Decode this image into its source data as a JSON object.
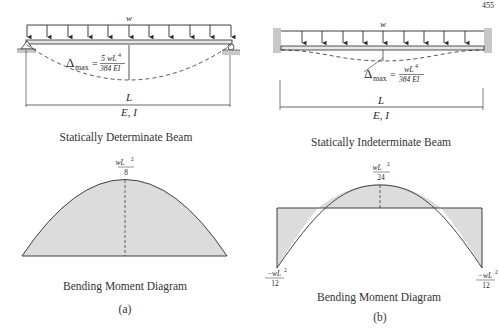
{
  "page": {
    "number": "455"
  },
  "panel_a": {
    "load_label": "w",
    "deflection_label": {
      "symbol": "Δ",
      "sub": "max",
      "eq": "=",
      "num": "5 wL",
      "num_exp": "4",
      "den": "384 EI"
    },
    "span_label": "L",
    "property_label": "E, I",
    "beam_caption": "Statically Determinate Beam",
    "moment_label": {
      "num": "wL",
      "exp": "2",
      "den": "8"
    },
    "moment_caption": "Bending Moment Diagram",
    "subfigure": "(a)"
  },
  "panel_b": {
    "load_label": "w",
    "deflection_label": {
      "symbol": "Δ",
      "sub": "max",
      "eq": "=",
      "num": "wL",
      "num_exp": "4",
      "den": "384 EI"
    },
    "span_label": "L",
    "property_label": "E, I",
    "beam_caption": "Statically Indeterminate Beam",
    "moment_label_mid": {
      "num": "wL",
      "exp": "2",
      "den": "24"
    },
    "moment_label_left": {
      "num": "−wL",
      "exp": "2",
      "den": "12"
    },
    "moment_label_right": {
      "num": "−wL",
      "exp": "2",
      "den": "12"
    },
    "moment_caption": "Bending Moment Diagram",
    "subfigure": "(b)"
  },
  "colors": {
    "line": "#2a2a2a",
    "fill": "#dcdcdc",
    "support": "#c8c8c8"
  }
}
